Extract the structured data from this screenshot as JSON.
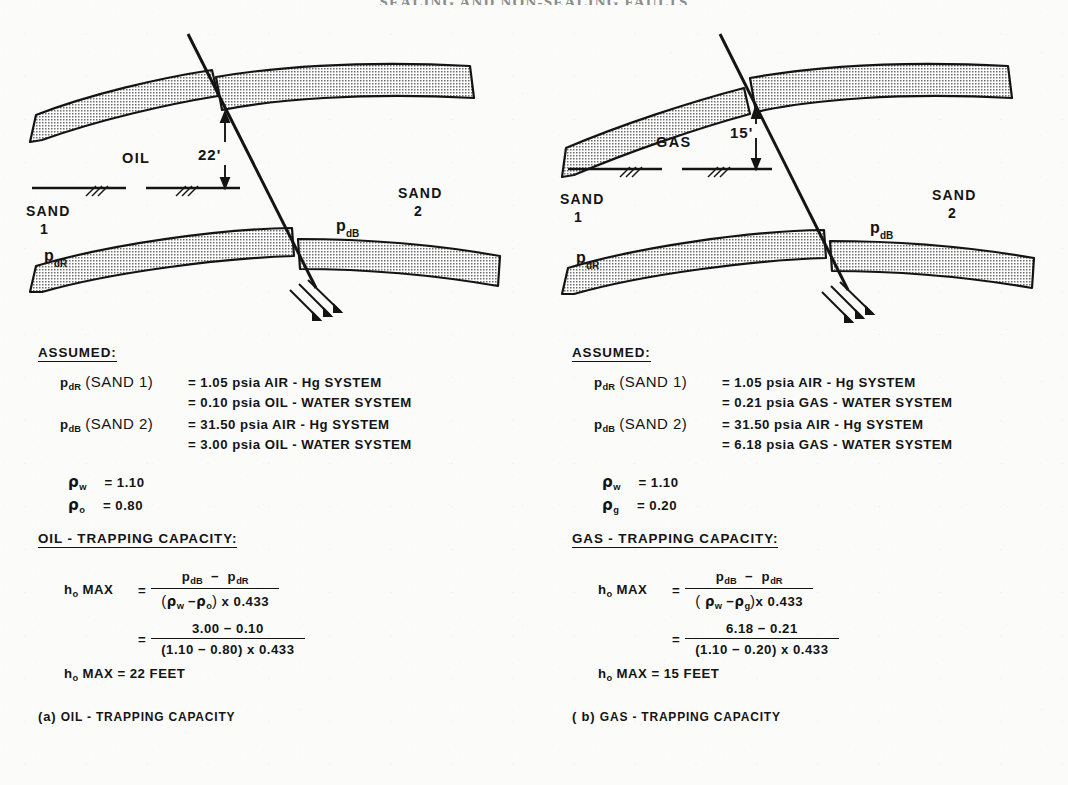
{
  "page": {
    "running_head": "SEALING AND NON-SEALING FAULTS",
    "width": 1068,
    "height": 785,
    "background": "#fbfbf9",
    "ink": "#141414"
  },
  "panels": [
    {
      "id": "oil",
      "caption_prefix": "(a)",
      "caption_text": "OIL - TRAPPING CAPACITY",
      "figure": {
        "fluid_label": "OIL",
        "throw_label": "22'",
        "sand_left_line1": "SAND",
        "sand_left_line2": "1",
        "sand_right_line1": "SAND",
        "sand_right_line2": "2",
        "pressure_left": "p",
        "pressure_left_sub": "dR",
        "pressure_right": "p",
        "pressure_right_sub": "dB",
        "shade_fill": "#c9c9c9",
        "stroke": "#141414"
      },
      "assumed_heading": "ASSUMED:",
      "assumed_rows": [
        {
          "symbol": "p",
          "symbol_sub": "dR",
          "qualifier": "(SAND 1)",
          "value": "= 1.05 psia  AIR - Hg  SYSTEM",
          "value_cont": "= 0.10 psia  OIL - WATER  SYSTEM"
        },
        {
          "symbol": "p",
          "symbol_sub": "dB",
          "qualifier": "(SAND 2)",
          "value": "= 31.50 psia  AIR - Hg  SYSTEM",
          "value_cont": "= 3.00 psia  OIL - WATER  SYSTEM"
        }
      ],
      "densities": [
        {
          "symbol_sub": "w",
          "value": "= 1.10"
        },
        {
          "symbol_sub": "o",
          "value": "= 0.80"
        }
      ],
      "capacity_heading": "OIL - TRAPPING CAPACITY:",
      "equation": {
        "label": "h",
        "label_sub": "o",
        "label_tail": "MAX",
        "equals": "=",
        "sym_numerator_a": "p",
        "sym_numerator_a_sub": "dB",
        "sym_numerator_minus": "−",
        "sym_numerator_b": "p",
        "sym_numerator_b_sub": "dR",
        "sym_denominator_open": "(",
        "sym_den_rho1_sub": "w",
        "sym_den_minus": "−",
        "sym_den_rho2_sub": "o",
        "sym_denominator_close": ")",
        "sym_den_factor": "x 0.433",
        "num_numerator": "3.00 − 0.10",
        "num_denominator": "(1.10 − 0.80) x 0.433",
        "result_label": "h",
        "result_label_sub": "o",
        "result_text": "MAX  =  22 FEET"
      }
    },
    {
      "id": "gas",
      "caption_prefix": "( b)",
      "caption_text": "GAS - TRAPPING CAPACITY",
      "figure": {
        "fluid_label": "GAS",
        "throw_label": "15'",
        "sand_left_line1": "SAND",
        "sand_left_line2": "1",
        "sand_right_line1": "SAND",
        "sand_right_line2": "2",
        "pressure_left": "p",
        "pressure_left_sub": "dR",
        "pressure_right": "p",
        "pressure_right_sub": "dB",
        "shade_fill": "#c9c9c9",
        "stroke": "#141414"
      },
      "assumed_heading": "ASSUMED:",
      "assumed_rows": [
        {
          "symbol": "p",
          "symbol_sub": "dR",
          "qualifier": "(SAND 1)",
          "value": "= 1.05 psia  AIR - Hg  SYSTEM",
          "value_cont": "= 0.21 psia  GAS - WATER  SYSTEM"
        },
        {
          "symbol": "p",
          "symbol_sub": "dB",
          "qualifier": "(SAND 2)",
          "value": "= 31.50 psia  AIR - Hg  SYSTEM",
          "value_cont": "= 6.18 psia  GAS - WATER  SYSTEM"
        }
      ],
      "densities": [
        {
          "symbol_sub": "w",
          "value": "= 1.10"
        },
        {
          "symbol_sub": "g",
          "value": "= 0.20"
        }
      ],
      "capacity_heading": "GAS - TRAPPING CAPACITY:",
      "equation": {
        "label": "h",
        "label_sub": "o",
        "label_tail": "MAX",
        "equals": "=",
        "sym_numerator_a": "p",
        "sym_numerator_a_sub": "dB",
        "sym_numerator_minus": "−",
        "sym_numerator_b": "p",
        "sym_numerator_b_sub": "dR",
        "sym_denominator_open": "(",
        "sym_den_rho1_sub": "w",
        "sym_den_minus": "−",
        "sym_den_rho2_sub": "g",
        "sym_denominator_close": ")",
        "sym_den_factor": "x 0.433",
        "num_numerator": "6.18 − 0.21",
        "num_denominator": "(1.10 − 0.20) x 0.433",
        "result_label": "h",
        "result_label_sub": "o",
        "result_text": "MAX  =  15 FEET"
      }
    }
  ]
}
